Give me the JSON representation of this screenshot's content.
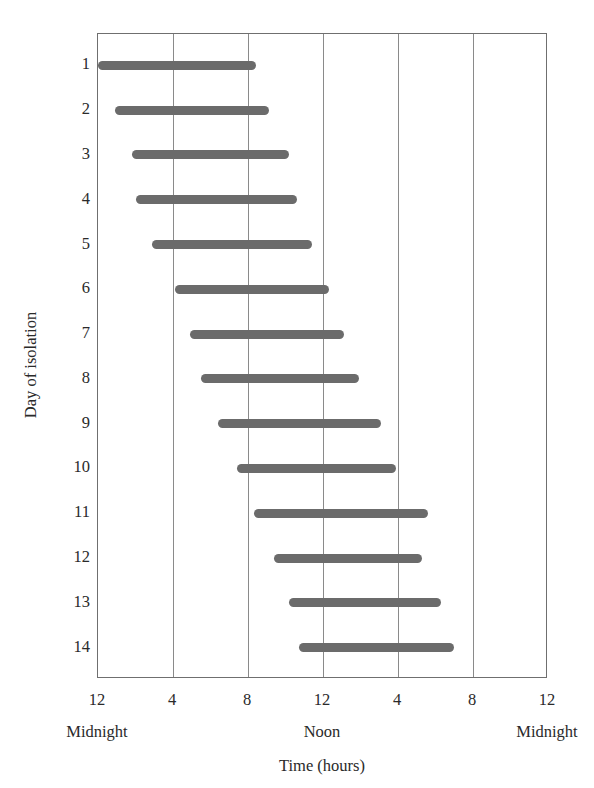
{
  "chart_data": {
    "type": "bar",
    "title": "",
    "subtitle": "",
    "xlabel": "Time (hours)",
    "ylabel": "Day of isolation",
    "orientation": "horizontal",
    "grid": true,
    "legend": null,
    "x_axis": {
      "unit": "hours from first midnight",
      "xlim": [
        0,
        24
      ],
      "tick_values": [
        0,
        4,
        8,
        12,
        16,
        20,
        24
      ],
      "tick_labels": [
        "12",
        "4",
        "8",
        "12",
        "4",
        "8",
        "12"
      ],
      "period_labels": [
        {
          "value": 0,
          "label": "Midnight"
        },
        {
          "value": 12,
          "label": "Noon"
        },
        {
          "value": 24,
          "label": "Midnight"
        }
      ]
    },
    "y_axis": {
      "categories": [
        "1",
        "2",
        "3",
        "4",
        "5",
        "6",
        "7",
        "8",
        "9",
        "10",
        "11",
        "12",
        "13",
        "14"
      ],
      "ylim": [
        0.3,
        14.7
      ],
      "inverted": true
    },
    "bars": [
      {
        "day": 1,
        "start": 0.0,
        "end": 8.4,
        "duration": 8.4
      },
      {
        "day": 2,
        "start": 0.9,
        "end": 9.1,
        "duration": 8.2
      },
      {
        "day": 3,
        "start": 1.8,
        "end": 10.2,
        "duration": 8.4
      },
      {
        "day": 4,
        "start": 2.0,
        "end": 10.6,
        "duration": 8.6
      },
      {
        "day": 5,
        "start": 2.9,
        "end": 11.4,
        "duration": 8.5
      },
      {
        "day": 6,
        "start": 4.1,
        "end": 12.3,
        "duration": 8.2
      },
      {
        "day": 7,
        "start": 4.9,
        "end": 13.1,
        "duration": 8.2
      },
      {
        "day": 8,
        "start": 5.5,
        "end": 13.9,
        "duration": 8.4
      },
      {
        "day": 9,
        "start": 6.4,
        "end": 15.1,
        "duration": 8.7
      },
      {
        "day": 10,
        "start": 7.4,
        "end": 15.9,
        "duration": 8.5
      },
      {
        "day": 11,
        "start": 8.3,
        "end": 17.6,
        "duration": 9.3
      },
      {
        "day": 12,
        "start": 9.4,
        "end": 17.3,
        "duration": 7.9
      },
      {
        "day": 13,
        "start": 10.2,
        "end": 18.3,
        "duration": 8.1
      },
      {
        "day": 14,
        "start": 10.7,
        "end": 19.0,
        "duration": 8.3
      }
    ]
  },
  "style": {
    "bar_color": "#6b6b6b",
    "grid_color": "#8a8a8a",
    "frame_color": "#6f6f6f",
    "text_color": "#2a2a2a",
    "background": "#ffffff"
  }
}
